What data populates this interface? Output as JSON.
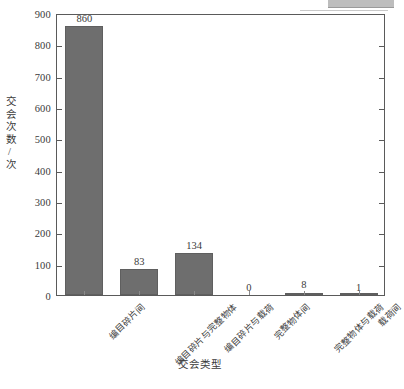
{
  "chart_data": {
    "type": "bar",
    "title": "",
    "xlabel": "交会类型",
    "ylabel": "交会次数/次",
    "categories": [
      "编目碎片间",
      "编目碎片与完整物体",
      "编目碎片与载荷",
      "完整物体间",
      "完整物体与载荷",
      "载荷间"
    ],
    "values": [
      860,
      83,
      134,
      0,
      8,
      1
    ],
    "value_labels": [
      "860",
      "83",
      "134",
      "0",
      "8",
      "1"
    ],
    "ylim": [
      0,
      900
    ],
    "yticks": [
      0,
      100,
      200,
      300,
      400,
      500,
      600,
      700,
      800,
      900
    ],
    "ytick_labels": [
      "0",
      "100",
      "200",
      "300",
      "400",
      "500",
      "600",
      "700",
      "800",
      "900"
    ],
    "grid": false,
    "legend": null,
    "bar_color": "#6e6e6e",
    "frame_color": "#5a5a5a"
  },
  "figure": {
    "caption": "",
    "artifact_present": true
  }
}
